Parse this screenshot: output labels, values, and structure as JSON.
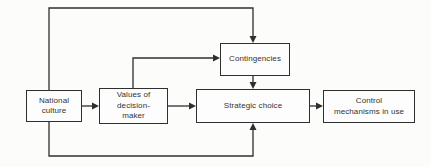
{
  "diagram": {
    "boxes": {
      "national_culture": "National\nculture",
      "values_of_decision_maker": "Values of\ndecision-\nmaker",
      "contingencies": "Contingencies",
      "strategic_choice": "Strategic choice",
      "control_mechanisms_in_use": "Control\nmechanisms in use"
    },
    "connections": [
      {
        "from": "national_culture",
        "to": "values_of_decision_maker"
      },
      {
        "from": "national_culture",
        "to": "contingencies",
        "route": "top-loop"
      },
      {
        "from": "national_culture",
        "to": "strategic_choice",
        "route": "bottom-loop"
      },
      {
        "from": "values_of_decision_maker",
        "to": "strategic_choice"
      },
      {
        "from": "values_of_decision_maker",
        "to": "contingencies",
        "route": "up-then-right"
      },
      {
        "from": "contingencies",
        "to": "strategic_choice"
      },
      {
        "from": "strategic_choice",
        "to": "control_mechanisms_in_use"
      }
    ],
    "colors": {
      "line": "#2f2f2f",
      "background": "#fcfcfb",
      "box_fill": "#fdfdfd",
      "text": "#333333"
    }
  }
}
